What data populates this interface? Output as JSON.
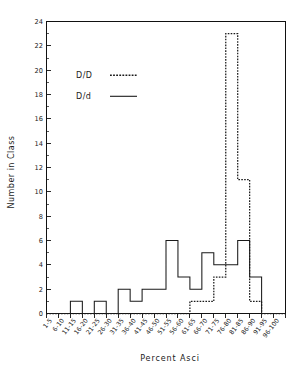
{
  "chart_data": {
    "type": "bar",
    "title": "",
    "subtitle": "",
    "xlabel": "Percent  Asci",
    "ylabel": "Number in Class",
    "categories": [
      "1-5",
      "6-10",
      "11-15",
      "16-20",
      "21-25",
      "26-30",
      "31-35",
      "36-40",
      "41-45",
      "46-50",
      "51-55",
      "56-60",
      "61-65",
      "66-70",
      "71-75",
      "76-80",
      "81-85",
      "86-90",
      "91-95",
      "96-100"
    ],
    "series": [
      {
        "name": "D/D",
        "style": "dashed",
        "values": [
          0,
          0,
          0,
          0,
          0,
          0,
          0,
          0,
          0,
          0,
          0,
          0,
          1,
          1,
          3,
          23,
          11,
          1,
          0,
          0
        ]
      },
      {
        "name": "D/d",
        "style": "solid",
        "values": [
          0,
          0,
          1,
          0,
          1,
          0,
          2,
          1,
          2,
          2,
          6,
          3,
          2,
          5,
          4,
          4,
          6,
          3,
          0,
          0
        ]
      }
    ],
    "ylim": [
      0,
      24
    ],
    "ytick_step": 2,
    "yticks": [
      0,
      2,
      4,
      6,
      8,
      10,
      12,
      14,
      16,
      18,
      20,
      22,
      24
    ],
    "grid": false,
    "legend_position": "upper-left",
    "legend": [
      {
        "label": "D/D",
        "style": "dashed"
      },
      {
        "label": "D/d",
        "style": "solid"
      }
    ],
    "axis_color": "#111111",
    "line_color": "#1a1a1a",
    "background": "#ffffff"
  },
  "figure": {
    "xaxis_title": "Percent  Asci",
    "yaxis_title": "Number in Class"
  }
}
